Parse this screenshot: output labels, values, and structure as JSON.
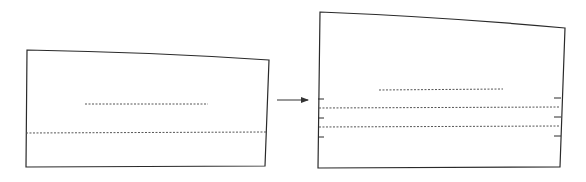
{
  "diagram": {
    "colors": {
      "background": "#ffffff",
      "outline": "#2a2a2a",
      "dashed": "#555555",
      "arrow": "#333333"
    },
    "left_piece": {
      "label": "original pattern piece",
      "outline_path": "M27,50 Q150,52 269,60 L265,166 L26,167 Z",
      "grainline": {
        "x1": 85,
        "y1": 104,
        "x2": 208,
        "y2": 104
      },
      "lengthen_line": {
        "x1": 26,
        "y1": 133,
        "x2": 266,
        "y2": 132
      }
    },
    "arrow": {
      "x1": 277,
      "y1": 100,
      "x2": 308,
      "y2": 100
    },
    "right_piece": {
      "label": "lengthened pattern piece",
      "outline_path": "M320,12 Q445,17 565,28 L560,167 L318,168 Z",
      "grainline": {
        "x1": 379,
        "y1": 90,
        "x2": 503,
        "y2": 89
      },
      "spread_lines": [
        {
          "x1": 319,
          "y1": 108,
          "x2": 560,
          "y2": 107
        },
        {
          "x1": 319,
          "y1": 127,
          "x2": 560,
          "y2": 126
        }
      ],
      "left_ticks": [
        99,
        118,
        137
      ],
      "right_ticks": [
        98,
        117,
        136
      ]
    }
  }
}
